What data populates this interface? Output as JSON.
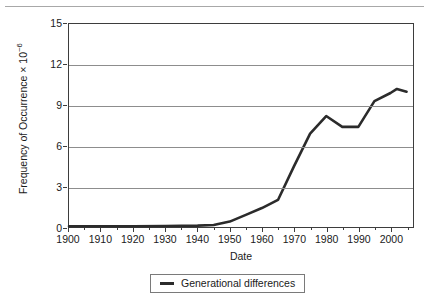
{
  "chart_data": {
    "type": "line",
    "title": "",
    "xlabel": "Date",
    "ylabel": "Frequency of Occurrence × 10",
    "ylabel_exponent": "−6",
    "xlim": [
      1900,
      2007
    ],
    "ylim": [
      0,
      15
    ],
    "yticks": [
      0,
      3,
      6,
      9,
      12,
      15
    ],
    "xticks": [
      1900,
      1910,
      1920,
      1930,
      1940,
      1950,
      1960,
      1970,
      1980,
      1990,
      2000
    ],
    "xticks_minor": [
      1905,
      1915,
      1925,
      1935,
      1945,
      1955,
      1965,
      1975,
      1985,
      1995,
      2005
    ],
    "grid": "horizontal",
    "legend_position": "bottom-center",
    "line_color": "#2b2b2b",
    "series": [
      {
        "name": "Generational differences",
        "x": [
          1900,
          1910,
          1920,
          1930,
          1940,
          1945,
          1950,
          1955,
          1960,
          1965,
          1970,
          1975,
          1980,
          1985,
          1990,
          1995,
          2000,
          2002,
          2005
        ],
        "values": [
          0.05,
          0.05,
          0.06,
          0.07,
          0.1,
          0.15,
          0.4,
          0.9,
          1.4,
          2.0,
          4.5,
          6.9,
          8.2,
          7.4,
          7.4,
          9.3,
          9.9,
          10.2,
          10.0
        ]
      }
    ]
  },
  "legend": {
    "entries": [
      {
        "label": "Generational differences"
      }
    ]
  }
}
